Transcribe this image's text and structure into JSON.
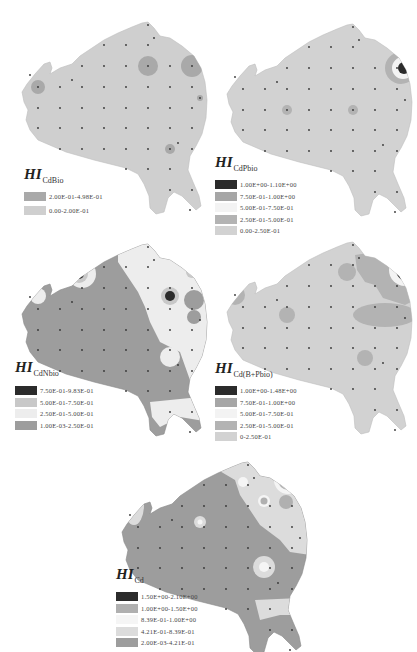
{
  "figure": {
    "panels": [
      {
        "id": "cdbio",
        "title_main": "HI",
        "title_sub": "CdBio",
        "legend": [
          {
            "label": "2.00E-01-4.98E-01",
            "color": "#a9a9a9"
          },
          {
            "label": "0.00-2.00E-01",
            "color": "#cfcfcf"
          }
        ]
      },
      {
        "id": "cdpbio",
        "title_main": "HI",
        "title_sub": "CdPbio",
        "legend": [
          {
            "label": "1.00E+00-1.10E+00",
            "color": "#2b2b2b"
          },
          {
            "label": "7.50E-01-1.00E+00",
            "color": "#a6a6a6"
          },
          {
            "label": "5.00E-01-7.50E-01",
            "color": "#f3f3f3"
          },
          {
            "label": "2.50E-01-5.00E-01",
            "color": "#b3b3b3"
          },
          {
            "label": "0.00-2.50E-01",
            "color": "#d2d2d2"
          }
        ]
      },
      {
        "id": "cdnbio",
        "title_main": "HI",
        "title_sub": "CdNbio",
        "legend": [
          {
            "label": "7.50E-01-9.83E-01",
            "color": "#2b2b2b"
          },
          {
            "label": "5.00E-01-7.50E-01",
            "color": "#c8c8c8"
          },
          {
            "label": "2.50E-01-5.00E-01",
            "color": "#ededed"
          },
          {
            "label": "1.00E-03-2.50E-01",
            "color": "#9d9d9d"
          }
        ]
      },
      {
        "id": "cdbpbio",
        "title_main": "HI",
        "title_sub": "Cd(B+Pbio)",
        "legend": [
          {
            "label": "1.00E+00-1.48E+00",
            "color": "#2b2b2b"
          },
          {
            "label": "7.50E-01-1.00E+00",
            "color": "#a6a6a6"
          },
          {
            "label": "5.00E-01-7.50E-01",
            "color": "#f3f3f3"
          },
          {
            "label": "2.50E-01-5.00E-01",
            "color": "#b3b3b3"
          },
          {
            "label": "0-2.50E-01",
            "color": "#d2d2d2"
          }
        ]
      },
      {
        "id": "cd",
        "title_main": "HI",
        "title_sub": "Cd",
        "legend": [
          {
            "label": "1.50E+00-2.10E+00",
            "color": "#2b2b2b"
          },
          {
            "label": "1.00E+00-1.50E+00",
            "color": "#b0b0b0"
          },
          {
            "label": "8.39E-01-1.00E+00",
            "color": "#f5f5f5"
          },
          {
            "label": "4.21E-01-8.39E-01",
            "color": "#dcdcdc"
          },
          {
            "label": "2.00E-03-4.21E-01",
            "color": "#9d9d9d"
          }
        ]
      }
    ]
  }
}
